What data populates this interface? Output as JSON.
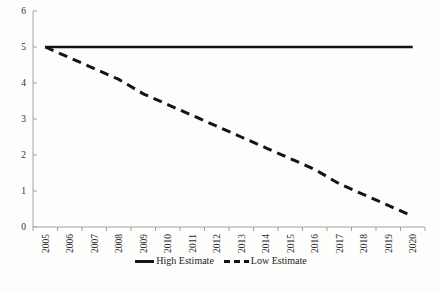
{
  "chart_data": {
    "type": "line",
    "title": "",
    "xlabel": "",
    "ylabel": "",
    "x": [
      "2005",
      "2006",
      "2007",
      "2008",
      "2009",
      "2010",
      "2011",
      "2012",
      "2013",
      "2014",
      "2015",
      "2016",
      "2017",
      "2018",
      "2019",
      "2020"
    ],
    "series": [
      {
        "name": "High Estimate",
        "style": "solid",
        "values": [
          5.0,
          5.0,
          5.0,
          5.0,
          5.0,
          5.0,
          5.0,
          5.0,
          5.0,
          5.0,
          5.0,
          5.0,
          5.0,
          5.0,
          5.0,
          5.0
        ]
      },
      {
        "name": "Low Estimate",
        "style": "dashed",
        "values": [
          5.0,
          4.7,
          4.4,
          4.1,
          3.7,
          3.4,
          3.1,
          2.8,
          2.5,
          2.2,
          1.9,
          1.6,
          1.2,
          0.9,
          0.6,
          0.3
        ]
      }
    ],
    "ylim": [
      0,
      6
    ],
    "ytick_interval": 1,
    "yticks": [
      "0",
      "1",
      "2",
      "3",
      "4",
      "5",
      "6"
    ],
    "grid": false,
    "legend_position": "bottom",
    "colors": {
      "line": "#141414",
      "axis": "#a3a3a3",
      "text": "#2e2e2e",
      "background": "#fdfdfc"
    }
  }
}
